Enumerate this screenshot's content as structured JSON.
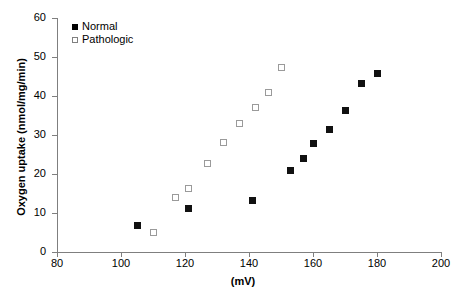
{
  "chart_data": {
    "type": "scatter",
    "title": "",
    "xlabel": "(mV)",
    "ylabel": "Oxygen uptake (nmol/mg/min)",
    "xlim": [
      80,
      200
    ],
    "ylim": [
      0,
      60
    ],
    "xticks": [
      80,
      100,
      120,
      140,
      160,
      180,
      200
    ],
    "yticks": [
      0,
      10,
      20,
      30,
      40,
      50,
      60
    ],
    "grid": false,
    "legend_position": "top-left",
    "series": [
      {
        "name": "Normal",
        "marker": "filled-square",
        "color": "#111111",
        "points": [
          {
            "x": 105,
            "y": 6.8
          },
          {
            "x": 121,
            "y": 11.2
          },
          {
            "x": 141,
            "y": 13.3
          },
          {
            "x": 153,
            "y": 20.8
          },
          {
            "x": 157,
            "y": 24.0
          },
          {
            "x": 160,
            "y": 27.8
          },
          {
            "x": 165,
            "y": 31.5
          },
          {
            "x": 170,
            "y": 36.2
          },
          {
            "x": 175,
            "y": 43.3
          },
          {
            "x": 180,
            "y": 45.8
          }
        ]
      },
      {
        "name": "Pathologic",
        "marker": "open-square",
        "color": "#9a9a9a",
        "points": [
          {
            "x": 110,
            "y": 5.0
          },
          {
            "x": 117,
            "y": 14.0
          },
          {
            "x": 121,
            "y": 16.3
          },
          {
            "x": 127,
            "y": 22.7
          },
          {
            "x": 132,
            "y": 28.0
          },
          {
            "x": 137,
            "y": 33.0
          },
          {
            "x": 142,
            "y": 37.0
          },
          {
            "x": 146,
            "y": 41.0
          },
          {
            "x": 150,
            "y": 47.3
          }
        ]
      }
    ]
  },
  "axes": {
    "x_tick_labels": [
      "80",
      "100",
      "120",
      "140",
      "160",
      "180",
      "200"
    ],
    "y_tick_labels": [
      "0",
      "10",
      "20",
      "30",
      "40",
      "50",
      "60"
    ],
    "x_title": "(mV)",
    "y_title": "Oxygen uptake (nmol/mg/min)"
  },
  "legend": {
    "entries": [
      {
        "label": "Normal",
        "marker": "filled-square"
      },
      {
        "label": "Pathologic",
        "marker": "open-square"
      }
    ]
  },
  "colors": {
    "axis": "#7f7f7f",
    "normal_marker": "#111111",
    "pathologic_marker_border": "#9a9a9a",
    "background": "#ffffff",
    "text": "#000000"
  }
}
